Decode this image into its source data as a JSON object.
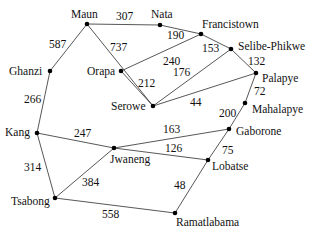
{
  "diagram": {
    "type": "weighted-graph",
    "nodes": [
      {
        "id": "Maun",
        "label": "Maun",
        "x": 87,
        "y": 24,
        "lx": 71,
        "ly": 18
      },
      {
        "id": "Nata",
        "label": "Nata",
        "x": 160,
        "y": 25,
        "lx": 151,
        "ly": 18
      },
      {
        "id": "Francistown",
        "label": "Francistown",
        "x": 201,
        "y": 34,
        "lx": 202,
        "ly": 28
      },
      {
        "id": "Selibe-Phikwe",
        "label": "Selibe-Phikwe",
        "x": 231,
        "y": 49,
        "lx": 238,
        "ly": 50
      },
      {
        "id": "Palapye",
        "label": "Palapye",
        "x": 256,
        "y": 73,
        "lx": 262,
        "ly": 82
      },
      {
        "id": "Mahalapye",
        "label": "Mahalapye",
        "x": 245,
        "y": 103,
        "lx": 252,
        "ly": 113
      },
      {
        "id": "Ghanzi",
        "label": "Ghanzi",
        "x": 50,
        "y": 71,
        "lx": 9,
        "ly": 75
      },
      {
        "id": "Orapa",
        "label": "Orapa",
        "x": 121,
        "y": 71,
        "lx": 87,
        "ly": 75
      },
      {
        "id": "Serowe",
        "label": "Serowe",
        "x": 153,
        "y": 106,
        "lx": 111,
        "ly": 110
      },
      {
        "id": "Gaborone",
        "label": "Gaborone",
        "x": 229,
        "y": 129,
        "lx": 236,
        "ly": 135
      },
      {
        "id": "Kang",
        "label": "Kang",
        "x": 37,
        "y": 133,
        "lx": 5,
        "ly": 136
      },
      {
        "id": "Jwaneng",
        "label": "Jwaneng",
        "x": 114,
        "y": 148,
        "lx": 110,
        "ly": 163
      },
      {
        "id": "Lobatse",
        "label": "Lobatse",
        "x": 208,
        "y": 160,
        "lx": 212,
        "ly": 170
      },
      {
        "id": "Tsabong",
        "label": "Tsabong",
        "x": 55,
        "y": 198,
        "lx": 11,
        "ly": 205
      },
      {
        "id": "Ramatlabama",
        "label": "Ramatlabama",
        "x": 175,
        "y": 213,
        "lx": 176,
        "ly": 226
      }
    ],
    "edges": [
      {
        "from": "Maun",
        "to": "Nata",
        "weight": "307",
        "wx": 116,
        "wy": 20
      },
      {
        "from": "Maun",
        "to": "Ghanzi",
        "weight": "587",
        "wx": 49,
        "wy": 48
      },
      {
        "from": "Maun",
        "to": "Serowe",
        "weight": "737",
        "wx": 110,
        "wy": 51
      },
      {
        "from": "Nata",
        "to": "Francistown",
        "weight": "190",
        "wx": 167,
        "wy": 39
      },
      {
        "from": "Orapa",
        "to": "Francistown",
        "weight": "240",
        "wx": 163,
        "wy": 65
      },
      {
        "from": "Orapa",
        "to": "Serowe",
        "weight": "212",
        "wx": 138,
        "wy": 87
      },
      {
        "from": "Francistown",
        "to": "Selibe-Phikwe",
        "weight": "153",
        "wx": 202,
        "wy": 52
      },
      {
        "from": "Serowe",
        "to": "Selibe-Phikwe",
        "weight": "176",
        "wx": 173,
        "wy": 76
      },
      {
        "from": "Selibe-Phikwe",
        "to": "Palapye",
        "weight": "132",
        "wx": 248,
        "wy": 65
      },
      {
        "from": "Serowe",
        "to": "Palapye",
        "weight": "44",
        "wx": 190,
        "wy": 106
      },
      {
        "from": "Palapye",
        "to": "Mahalapye",
        "weight": "72",
        "wx": 254,
        "wy": 95
      },
      {
        "from": "Mahalapye",
        "to": "Gaborone",
        "weight": "200",
        "wx": 219,
        "wy": 117
      },
      {
        "from": "Ghanzi",
        "to": "Kang",
        "weight": "266",
        "wx": 24,
        "wy": 103
      },
      {
        "from": "Kang",
        "to": "Jwaneng",
        "weight": "247",
        "wx": 74,
        "wy": 137
      },
      {
        "from": "Jwaneng",
        "to": "Gaborone",
        "weight": "163",
        "wx": 163,
        "wy": 133
      },
      {
        "from": "Jwaneng",
        "to": "Lobatse",
        "weight": "126",
        "wx": 165,
        "wy": 152
      },
      {
        "from": "Gaborone",
        "to": "Lobatse",
        "weight": "75",
        "wx": 222,
        "wy": 154
      },
      {
        "from": "Kang",
        "to": "Tsabong",
        "weight": "314",
        "wx": 24,
        "wy": 171
      },
      {
        "from": "Jwaneng",
        "to": "Tsabong",
        "weight": "384",
        "wx": 82,
        "wy": 186
      },
      {
        "from": "Lobatse",
        "to": "Ramatlabama",
        "weight": "48",
        "wx": 174,
        "wy": 189
      },
      {
        "from": "Tsabong",
        "to": "Ramatlabama",
        "weight": "558",
        "wx": 102,
        "wy": 218
      }
    ]
  }
}
